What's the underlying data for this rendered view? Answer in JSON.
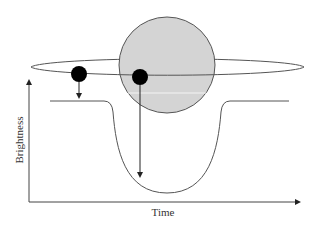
{
  "diagram": {
    "type": "transit-light-curve",
    "labels": {
      "x_axis": "Time",
      "y_axis": "Brightness"
    },
    "elements": {
      "star": {
        "shape": "circle",
        "fill": "#d4d4d4",
        "stroke": "#555555"
      },
      "orbit": {
        "shape": "ellipse",
        "stroke": "#555555"
      },
      "planets": [
        {
          "position": "outside-star",
          "fill": "#000000",
          "arrow_to": "baseline"
        },
        {
          "position": "in-front-of-star",
          "fill": "#000000",
          "arrow_to": "curve-minimum"
        }
      ],
      "light_curve": {
        "stroke": "#555555",
        "shape": "flat-dip-flat"
      }
    },
    "colors": {
      "line": "#555555",
      "star_fill": "#d4d4d4",
      "planet_fill": "#000000",
      "axis": "#444444"
    }
  }
}
